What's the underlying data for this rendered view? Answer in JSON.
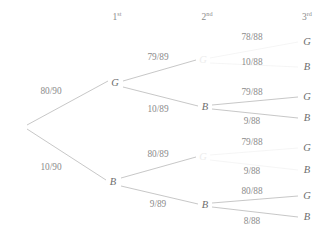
{
  "diagram": {
    "type": "probability-tree",
    "stage_headers": [
      {
        "label": "1",
        "sup": "st",
        "x": 117,
        "y": 18
      },
      {
        "label": "2",
        "sup": "nd",
        "x": 207,
        "y": 18
      },
      {
        "label": "3",
        "sup": "rd",
        "x": 307,
        "y": 18
      }
    ],
    "nodes": [
      {
        "id": "root",
        "label": "",
        "x": 25,
        "y": 127,
        "faded": false,
        "hidden": true
      },
      {
        "id": "n1G",
        "label": "G",
        "x": 115,
        "y": 83,
        "faded": false,
        "hidden": false
      },
      {
        "id": "n1B",
        "label": "B",
        "x": 113,
        "y": 182,
        "faded": false,
        "hidden": false
      },
      {
        "id": "n2GG",
        "label": "G",
        "x": 203,
        "y": 60,
        "faded": true,
        "hidden": false
      },
      {
        "id": "n2GB",
        "label": "B",
        "x": 205,
        "y": 107,
        "faded": false,
        "hidden": false
      },
      {
        "id": "n2BG",
        "label": "G",
        "x": 203,
        "y": 157,
        "faded": true,
        "hidden": false
      },
      {
        "id": "n2BB",
        "label": "B",
        "x": 205,
        "y": 205,
        "faded": false,
        "hidden": false
      }
    ],
    "outcomes": [
      {
        "id": "o1",
        "label": "G",
        "x": 307,
        "y": 42
      },
      {
        "id": "o2",
        "label": "B",
        "x": 307,
        "y": 67
      },
      {
        "id": "o3",
        "label": "G",
        "x": 307,
        "y": 97
      },
      {
        "id": "o4",
        "label": "B",
        "x": 307,
        "y": 118
      },
      {
        "id": "o5",
        "label": "G",
        "x": 307,
        "y": 148
      },
      {
        "id": "o6",
        "label": "B",
        "x": 307,
        "y": 170
      },
      {
        "id": "o7",
        "label": "G",
        "x": 307,
        "y": 196
      },
      {
        "id": "o8",
        "label": "B",
        "x": 307,
        "y": 217
      }
    ],
    "edges": [
      {
        "id": "e-root-G",
        "from": "root",
        "to": "n1G",
        "x1": 27,
        "y1": 125,
        "x2": 108,
        "y2": 81,
        "visible": true
      },
      {
        "id": "e-root-B",
        "from": "root",
        "to": "n1B",
        "x1": 27,
        "y1": 129,
        "x2": 106,
        "y2": 180,
        "visible": true
      },
      {
        "id": "e-G-GG",
        "from": "n1G",
        "to": "n2GG",
        "x1": 123,
        "y1": 81,
        "x2": 196,
        "y2": 60,
        "visible": true
      },
      {
        "id": "e-G-GB",
        "from": "n1G",
        "to": "n2GB",
        "x1": 123,
        "y1": 87,
        "x2": 198,
        "y2": 106,
        "visible": true
      },
      {
        "id": "e-B-BG",
        "from": "n1B",
        "to": "n2BG",
        "x1": 121,
        "y1": 178,
        "x2": 196,
        "y2": 157,
        "visible": true
      },
      {
        "id": "e-B-BB",
        "from": "n1B",
        "to": "n2BB",
        "x1": 121,
        "y1": 186,
        "x2": 198,
        "y2": 204,
        "visible": true
      },
      {
        "id": "e-GG-G",
        "from": "n2GG",
        "to": "o1",
        "x1": 210,
        "y1": 58,
        "x2": 298,
        "y2": 42,
        "visible": false
      },
      {
        "id": "e-GG-B",
        "from": "n2GG",
        "to": "o2",
        "x1": 210,
        "y1": 63,
        "x2": 298,
        "y2": 67,
        "visible": false
      },
      {
        "id": "e-GB-G",
        "from": "n2GB",
        "to": "o3",
        "x1": 212,
        "y1": 105,
        "x2": 298,
        "y2": 97,
        "visible": true
      },
      {
        "id": "e-GB-B",
        "from": "n2GB",
        "to": "o4",
        "x1": 212,
        "y1": 109,
        "x2": 298,
        "y2": 118,
        "visible": true
      },
      {
        "id": "e-BG-G",
        "from": "n2BG",
        "to": "o5",
        "x1": 210,
        "y1": 155,
        "x2": 298,
        "y2": 148,
        "visible": false
      },
      {
        "id": "e-BG-B",
        "from": "n2BG",
        "to": "o6",
        "x1": 210,
        "y1": 160,
        "x2": 298,
        "y2": 170,
        "visible": false
      },
      {
        "id": "e-BB-G",
        "from": "n2BB",
        "to": "o7",
        "x1": 212,
        "y1": 203,
        "x2": 298,
        "y2": 196,
        "visible": true
      },
      {
        "id": "e-BB-B",
        "from": "n2BB",
        "to": "o8",
        "x1": 212,
        "y1": 207,
        "x2": 298,
        "y2": 217,
        "visible": true
      }
    ],
    "edge_labels": [
      {
        "id": "p-root-G",
        "text": "80/90",
        "x": 51,
        "y": 92
      },
      {
        "id": "p-root-B",
        "text": "10/90",
        "x": 51,
        "y": 168
      },
      {
        "id": "p-G-GG",
        "text": "79/89",
        "x": 158,
        "y": 58
      },
      {
        "id": "p-G-GB",
        "text": "10/89",
        "x": 158,
        "y": 110
      },
      {
        "id": "p-B-BG",
        "text": "80/89",
        "x": 158,
        "y": 155
      },
      {
        "id": "p-B-BB",
        "text": "9/89",
        "x": 158,
        "y": 205
      },
      {
        "id": "p-GG-G",
        "text": "78/88",
        "x": 252,
        "y": 38
      },
      {
        "id": "p-GG-B",
        "text": "10/88",
        "x": 252,
        "y": 63
      },
      {
        "id": "p-GB-G",
        "text": "79/88",
        "x": 252,
        "y": 93
      },
      {
        "id": "p-GB-B",
        "text": "9/88",
        "x": 252,
        "y": 122
      },
      {
        "id": "p-BG-G",
        "text": "79/88",
        "x": 252,
        "y": 143
      },
      {
        "id": "p-BG-B",
        "text": "9/88",
        "x": 252,
        "y": 172
      },
      {
        "id": "p-BB-G",
        "text": "80/88",
        "x": 252,
        "y": 192
      },
      {
        "id": "p-BB-B",
        "text": "8/88",
        "x": 252,
        "y": 222
      }
    ],
    "colors": {
      "line": "#b9b9b9",
      "line_faded": "#f2f2f2",
      "text": "#7a7a7a",
      "node_text": "#6e6e6e",
      "background": "#ffffff"
    }
  }
}
